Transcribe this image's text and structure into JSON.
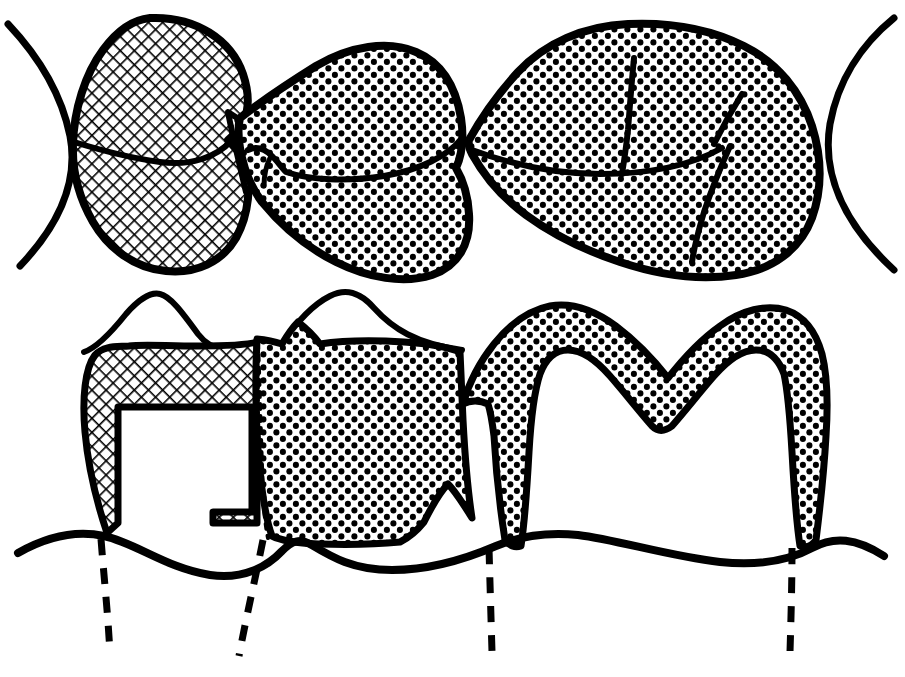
{
  "figure": {
    "title": "Fixed partial denture (three-unit bridge) — occlusal and buccal cross-section views",
    "width": 905,
    "height": 677,
    "background_color": "#ffffff",
    "ink_color": "#000000",
    "views": [
      {
        "id": "occlusal-view",
        "name": "Occlusal view",
        "position": "top",
        "description": "Top-down occlusal outline of a three-unit bridge flanked by two adjacent natural teeth shown only as arcs."
      },
      {
        "id": "buccal-section-view",
        "name": "Buccal cross-section view",
        "position": "bottom",
        "description": "Faciolingual sectioned view showing the crosshatched premolar retainer over a prepared tooth, the stippled pontic, and the stippled molar retainer shell over a prepared abutment, all above a scalloped gingival line with dashed root outlines."
      }
    ],
    "patterns": [
      {
        "id": "crosshatch",
        "name": "crosshatch-hatching",
        "meaning": "Premolar retainer / first bridge abutment casting",
        "angle_degrees": 45,
        "spacing_px": 10,
        "stroke_width_px": 3,
        "color": "#000000"
      },
      {
        "id": "stipple",
        "name": "dot-stipple-shading",
        "meaning": "Pontic and molar retainer casting",
        "dot_diameter_px": 6,
        "spacing_px": 13,
        "color": "#000000"
      }
    ],
    "units": [
      {
        "id": "premolar-retainer",
        "label": "Premolar retainer",
        "pattern": "crosshatch",
        "view": "both"
      },
      {
        "id": "pontic",
        "label": "Pontic",
        "pattern": "stipple",
        "view": "both"
      },
      {
        "id": "molar-retainer",
        "label": "Molar retainer",
        "pattern": "stipple",
        "view": "both"
      },
      {
        "id": "adjacent-tooth-left",
        "label": "Adjacent tooth (left)",
        "pattern": "outline-only",
        "view": "occlusal"
      },
      {
        "id": "adjacent-tooth-right",
        "label": "Adjacent tooth (right)",
        "pattern": "outline-only",
        "view": "occlusal"
      }
    ],
    "annotations": {
      "gingival_line_label": "Gingival margin",
      "root_outline_count": 4,
      "root_outline_style": "dashed"
    }
  }
}
